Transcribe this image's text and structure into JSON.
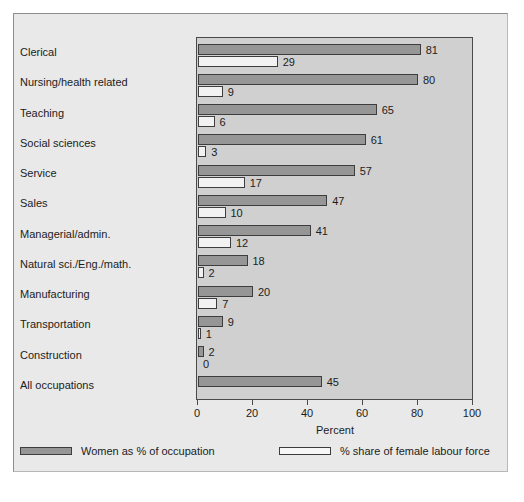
{
  "chart_data": {
    "type": "bar",
    "orientation": "horizontal",
    "title": "",
    "xlabel": "Percent",
    "ylabel": "",
    "xlim": [
      0,
      100
    ],
    "xticks": [
      0,
      20,
      40,
      60,
      80,
      100
    ],
    "xtick_labels": [
      "0",
      "20",
      "40",
      "60",
      "80",
      "100"
    ],
    "grid": false,
    "legend_position": "bottom",
    "categories": [
      "Clerical",
      "Nursing/health related",
      "Teaching",
      "Social sciences",
      "Service",
      "Sales",
      "Managerial/admin.",
      "Natural sci./Eng./math.",
      "Manufacturing",
      "Transportation",
      "Construction",
      "All occupations"
    ],
    "series": [
      {
        "name": "Women as % of occupation",
        "color": "#969696",
        "values": [
          81,
          80,
          65,
          61,
          57,
          47,
          41,
          18,
          20,
          9,
          2,
          45
        ],
        "labels": [
          "81",
          "80",
          "65",
          "61",
          "57",
          "47",
          "41",
          "18",
          "20",
          "9",
          "2",
          "45"
        ]
      },
      {
        "name": "% share of female labour force",
        "color": "#f2f2f2",
        "values": [
          29,
          9,
          6,
          3,
          17,
          10,
          12,
          2,
          7,
          1,
          0,
          null
        ],
        "labels": [
          "29",
          "9",
          "6",
          "3",
          "17",
          "10",
          "12",
          "2",
          "7",
          "1",
          "0",
          ""
        ]
      }
    ]
  },
  "axis": {
    "x_title": "Percent"
  },
  "legend": {
    "entries": [
      {
        "label": "Women as % of occupation",
        "swatch": "dark"
      },
      {
        "label": "% share of female labour force",
        "swatch": "light"
      }
    ]
  }
}
